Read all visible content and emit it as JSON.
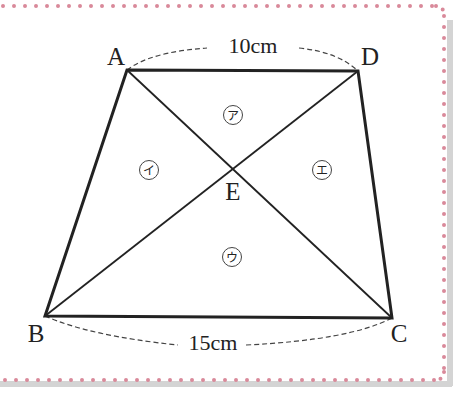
{
  "figure": {
    "type": "trapezoid-diagram",
    "frame": {
      "border_color": "#d9899a",
      "shadow_color": "#cfcfcf",
      "background": "#ffffff"
    },
    "vertices": [
      {
        "id": "A",
        "label": "A",
        "x": 127,
        "y": 70,
        "label_x": 116,
        "label_y": 65
      },
      {
        "id": "D",
        "label": "D",
        "x": 358,
        "y": 71,
        "label_x": 370,
        "label_y": 65
      },
      {
        "id": "B",
        "label": "B",
        "x": 45,
        "y": 316,
        "label_x": 36,
        "label_y": 342
      },
      {
        "id": "C",
        "label": "C",
        "x": 392,
        "y": 318,
        "label_x": 399,
        "label_y": 342
      },
      {
        "id": "E",
        "label": "E",
        "x": 233,
        "y": 170,
        "label_x": 233,
        "label_y": 200
      }
    ],
    "dimensions": [
      {
        "id": "AD",
        "label": "10cm",
        "text_x": 253,
        "text_y": 53
      },
      {
        "id": "BC",
        "label": "15cm",
        "text_x": 213,
        "text_y": 350
      }
    ],
    "regions": [
      {
        "id": "ア",
        "label": "ア",
        "x": 233,
        "y": 115
      },
      {
        "id": "イ",
        "label": "イ",
        "x": 149,
        "y": 170
      },
      {
        "id": "ウ",
        "label": "ウ",
        "x": 232,
        "y": 257
      },
      {
        "id": "エ",
        "label": "エ",
        "x": 322,
        "y": 170
      }
    ],
    "colors": {
      "line": "#222222",
      "dash": "#444444",
      "dot_border": "#d9899a"
    }
  }
}
